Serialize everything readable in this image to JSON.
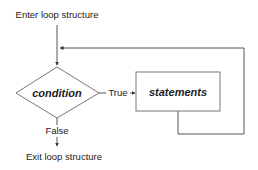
{
  "diagram": {
    "type": "flowchart",
    "title": "Loop structure",
    "labels": {
      "enter": "Enter loop structure",
      "exit": "Exit loop structure",
      "true": "True",
      "false": "False"
    },
    "nodes": [
      {
        "id": "condition",
        "shape": "diamond",
        "label": "condition"
      },
      {
        "id": "statements",
        "shape": "rectangle",
        "label": "statements"
      }
    ],
    "edges": [
      {
        "from": "enter",
        "to": "condition",
        "label": ""
      },
      {
        "from": "condition",
        "to": "statements",
        "label": "True"
      },
      {
        "from": "statements",
        "to": "condition",
        "label": "",
        "note": "loop back"
      },
      {
        "from": "condition",
        "to": "exit",
        "label": "False"
      }
    ]
  }
}
